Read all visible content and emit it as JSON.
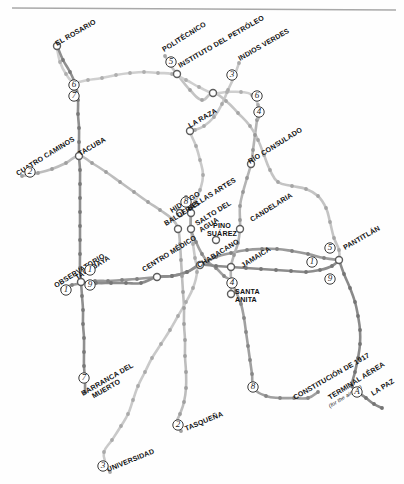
{
  "map": {
    "title": "Mexico City Metro Schematic Map",
    "width": 404,
    "height": 484,
    "background_color": "#fefefe",
    "top_rule_color": "#a8a8a8",
    "style": "grayscale schematic transit diagram"
  },
  "palette": {
    "line_1": "#9a9a9a",
    "line_2": "#bdbdbd",
    "line_3": "#c9c9c9",
    "line_4": "#b4b4b4",
    "line_5": "#c4c4c4",
    "line_6": "#cfcfcf",
    "line_7": "#8f8f8f",
    "line_8": "#a0a0a0",
    "line_9": "#8c8c8c",
    "line_A": "#8a8a8a",
    "station_dot": "#9d9d9d",
    "hub_stroke": "#5d5d5d",
    "label_text": "#111111",
    "badge_text": "#1c1c1c"
  },
  "line_badges": [
    {
      "id": "badge-6-rosario",
      "label": "6",
      "x": 74,
      "y": 85
    },
    {
      "id": "badge-7-rosario",
      "label": "7",
      "x": 74,
      "y": 96
    },
    {
      "id": "badge-2-cuatrocaminos",
      "label": "2",
      "x": 30,
      "y": 172
    },
    {
      "id": "badge-5-politecnico",
      "label": "5",
      "x": 171,
      "y": 62
    },
    {
      "id": "badge-3-indiosverdes",
      "label": "3",
      "x": 232,
      "y": 75
    },
    {
      "id": "badge-6-east",
      "label": "6",
      "x": 257,
      "y": 96
    },
    {
      "id": "badge-4-east",
      "label": "4",
      "x": 259,
      "y": 112
    },
    {
      "id": "badge-8-bellasartes",
      "label": "8",
      "x": 186,
      "y": 202
    },
    {
      "id": "badge-1-tacubaya-n",
      "label": "1",
      "x": 90,
      "y": 270
    },
    {
      "id": "badge-9-tacubaya",
      "label": "9",
      "x": 90,
      "y": 285
    },
    {
      "id": "badge-1-observatorio",
      "label": "1",
      "x": 66,
      "y": 290
    },
    {
      "id": "badge-7-barranca",
      "label": "7",
      "x": 84,
      "y": 378
    },
    {
      "id": "badge-3-universidad",
      "label": "3",
      "x": 103,
      "y": 466
    },
    {
      "id": "badge-2-tasquena",
      "label": "2",
      "x": 178,
      "y": 425
    },
    {
      "id": "badge-4-santaanita",
      "label": "4",
      "x": 232,
      "y": 283
    },
    {
      "id": "badge-8-constitucion",
      "label": "8",
      "x": 253,
      "y": 387
    },
    {
      "id": "badge-5-pantitlan",
      "label": "5",
      "x": 330,
      "y": 248
    },
    {
      "id": "badge-1-pantitlan",
      "label": "1",
      "x": 312,
      "y": 262
    },
    {
      "id": "badge-9-pantitlan",
      "label": "9",
      "x": 330,
      "y": 279
    },
    {
      "id": "badge-A-lapaz",
      "label": "A",
      "x": 357,
      "y": 392
    }
  ],
  "stations": [
    {
      "id": "el-rosario",
      "label": "EL ROSARIO",
      "x": 57,
      "y": 46,
      "type": "terminal",
      "angle": -30
    },
    {
      "id": "politecnico",
      "label": "POLITÉCNICO",
      "x": 164,
      "y": 52,
      "type": "terminal",
      "angle": -32
    },
    {
      "id": "instituto-del-petroleo",
      "label": "INSTITUTO DEL PETRÓLEO",
      "x": 180,
      "y": 68,
      "type": "hub",
      "angle": -30
    },
    {
      "id": "indios-verdes",
      "label": "INDIOS VERDES",
      "x": 240,
      "y": 61,
      "type": "terminal",
      "angle": -30
    },
    {
      "id": "cuatro-caminos",
      "label": "CUATRO CAMINOS",
      "x": 18,
      "y": 176,
      "type": "terminal",
      "angle": -32
    },
    {
      "id": "tacuba",
      "label": "TACUBA",
      "x": 80,
      "y": 156,
      "type": "hub",
      "angle": -30
    },
    {
      "id": "la-raza",
      "label": "LA RAZA",
      "x": 190,
      "y": 128,
      "type": "hub",
      "angle": -30
    },
    {
      "id": "rio-consulado",
      "label": "RÍO CONSULADO",
      "x": 250,
      "y": 164,
      "type": "hub",
      "angle": -32
    },
    {
      "id": "hidalgo",
      "label": "HIDALGO",
      "x": 172,
      "y": 213,
      "type": "hub",
      "angle": -32
    },
    {
      "id": "bellas-artes",
      "label": "BELLAS ARTES",
      "x": 189,
      "y": 211,
      "type": "hub",
      "angle": -32
    },
    {
      "id": "salto-del-agua",
      "label": "SALTO DEL AGUA",
      "x": 197,
      "y": 226,
      "type": "hub",
      "angle": -32
    },
    {
      "id": "balderas",
      "label": "BALDERAS",
      "x": 166,
      "y": 226,
      "type": "hub",
      "angle": -32
    },
    {
      "id": "pino-suarez",
      "label": "PINO SUÁREZ",
      "x": 222,
      "y": 228,
      "type": "hub",
      "angle": 0
    },
    {
      "id": "candelaria",
      "label": "CANDELARIA",
      "x": 252,
      "y": 222,
      "type": "hub",
      "angle": -32
    },
    {
      "id": "jamaica",
      "label": "JAMAICA",
      "x": 243,
      "y": 268,
      "type": "hub",
      "angle": -32
    },
    {
      "id": "santa-anita",
      "label": "SANTA ANITA",
      "x": 235,
      "y": 294,
      "type": "hub",
      "angle": 0
    },
    {
      "id": "chabacano",
      "label": "CHABACANO",
      "x": 199,
      "y": 268,
      "type": "hub",
      "angle": -32
    },
    {
      "id": "centro-medico",
      "label": "CENTRO MÉDICO",
      "x": 144,
      "y": 272,
      "type": "hub",
      "angle": -32
    },
    {
      "id": "tacubaya",
      "label": "TACUBAYA",
      "x": 77,
      "y": 280,
      "type": "hub",
      "angle": -32
    },
    {
      "id": "observatorio",
      "label": "OBSERVATORIO",
      "x": 56,
      "y": 288,
      "type": "terminal",
      "angle": -32
    },
    {
      "id": "barranca-del-muerto",
      "label": "BARRANCA DEL MUERTO",
      "x": 83,
      "y": 396,
      "type": "terminal",
      "angle": -30
    },
    {
      "id": "universidad",
      "label": "UNIVERSIDAD",
      "x": 108,
      "y": 472,
      "type": "terminal",
      "angle": -22
    },
    {
      "id": "tasquena",
      "label": "TASQUEÑA",
      "x": 186,
      "y": 431,
      "type": "terminal",
      "angle": -22
    },
    {
      "id": "constitucion-de-1917",
      "label": "CONSTITUCIÓN DE 1917",
      "x": 295,
      "y": 400,
      "type": "terminal",
      "angle": -30
    },
    {
      "id": "terminal-aerea",
      "label": "TERMINAL AÉREA",
      "x": 330,
      "y": 400,
      "type": "terminal",
      "angle": -32
    },
    {
      "id": "terminal-aerea-sub",
      "label": "(for the airport)",
      "x": 330,
      "y": 408,
      "type": "sublabel",
      "angle": -32
    },
    {
      "id": "pantitlan",
      "label": "PANTITLÁN",
      "x": 345,
      "y": 250,
      "type": "hub",
      "angle": -30
    },
    {
      "id": "la-paz",
      "label": "LA PAZ",
      "x": 373,
      "y": 396,
      "type": "terminal",
      "angle": -32
    }
  ],
  "interchange_nodes": [
    {
      "id": "node-el-rosario",
      "x": 57,
      "y": 46
    },
    {
      "id": "node-instituto-petroleo",
      "x": 177,
      "y": 74
    },
    {
      "id": "node-tacuba",
      "x": 79,
      "y": 156
    },
    {
      "id": "node-la-raza",
      "x": 190,
      "y": 131
    },
    {
      "id": "node-deportivo-18",
      "x": 213,
      "y": 93
    },
    {
      "id": "node-rio-consulado",
      "x": 251,
      "y": 164
    },
    {
      "id": "node-hidalgo",
      "x": 180,
      "y": 213
    },
    {
      "id": "node-bellas-artes",
      "x": 191,
      "y": 213
    },
    {
      "id": "node-balderas",
      "x": 178,
      "y": 229
    },
    {
      "id": "node-salto-agua",
      "x": 191,
      "y": 229
    },
    {
      "id": "node-pino-suarez",
      "x": 216,
      "y": 240
    },
    {
      "id": "node-candelaria",
      "x": 240,
      "y": 229
    },
    {
      "id": "node-chabacano",
      "x": 200,
      "y": 265
    },
    {
      "id": "node-centro-medico",
      "x": 157,
      "y": 277
    },
    {
      "id": "node-jamaica",
      "x": 231,
      "y": 267
    },
    {
      "id": "node-santa-anita",
      "x": 231,
      "y": 294
    },
    {
      "id": "node-tacubaya",
      "x": 81,
      "y": 282
    },
    {
      "id": "node-pantitlan",
      "x": 339,
      "y": 260
    }
  ],
  "lines": [
    {
      "id": "line-1",
      "name": "Línea 1",
      "color": "#9a9a9a",
      "terminals": [
        "OBSERVATORIO",
        "PANTITLÁN"
      ]
    },
    {
      "id": "line-2",
      "name": "Línea 2",
      "color": "#bdbdbd",
      "terminals": [
        "CUATRO CAMINOS",
        "TASQUEÑA"
      ]
    },
    {
      "id": "line-3",
      "name": "Línea 3",
      "color": "#c9c9c9",
      "terminals": [
        "INDIOS VERDES",
        "UNIVERSIDAD"
      ]
    },
    {
      "id": "line-4",
      "name": "Línea 4",
      "color": "#b4b4b4",
      "terminals": [
        "MARTÍN CARRERA",
        "SANTA ANITA"
      ]
    },
    {
      "id": "line-5",
      "name": "Línea 5",
      "color": "#c4c4c4",
      "terminals": [
        "POLITÉCNICO",
        "PANTITLÁN"
      ]
    },
    {
      "id": "line-6",
      "name": "Línea 6",
      "color": "#cfcfcf",
      "terminals": [
        "EL ROSARIO",
        "MARTÍN CARRERA"
      ]
    },
    {
      "id": "line-7",
      "name": "Línea 7",
      "color": "#8f8f8f",
      "terminals": [
        "EL ROSARIO",
        "BARRANCA DEL MUERTO"
      ]
    },
    {
      "id": "line-8",
      "name": "Línea 8",
      "color": "#a0a0a0",
      "terminals": [
        "GARIBALDI",
        "CONSTITUCIÓN DE 1917"
      ]
    },
    {
      "id": "line-9",
      "name": "Línea 9",
      "color": "#8c8c8c",
      "terminals": [
        "TACUBAYA",
        "PANTITLÁN"
      ]
    },
    {
      "id": "line-A",
      "name": "Línea A",
      "color": "#8a8a8a",
      "terminals": [
        "PANTITLÁN",
        "LA PAZ"
      ]
    }
  ],
  "dots_line_1": [
    [
      62,
      289
    ],
    [
      72,
      285
    ],
    [
      95,
      281
    ],
    [
      108,
      281
    ],
    [
      122,
      280
    ],
    [
      137,
      279
    ],
    [
      157,
      277
    ],
    [
      172,
      276
    ],
    [
      187,
      272
    ],
    [
      200,
      265
    ],
    [
      216,
      257
    ],
    [
      231,
      253
    ],
    [
      247,
      250
    ],
    [
      262,
      249
    ],
    [
      277,
      249
    ],
    [
      292,
      251
    ],
    [
      308,
      254
    ],
    [
      324,
      258
    ],
    [
      339,
      260
    ]
  ],
  "dots_line_2": [
    [
      22,
      176
    ],
    [
      38,
      173
    ],
    [
      52,
      169
    ],
    [
      66,
      163
    ],
    [
      79,
      156
    ],
    [
      92,
      163
    ],
    [
      106,
      172
    ],
    [
      120,
      182
    ],
    [
      134,
      192
    ],
    [
      148,
      202
    ],
    [
      160,
      210
    ],
    [
      172,
      219
    ],
    [
      178,
      229
    ],
    [
      180,
      244
    ],
    [
      181,
      260
    ],
    [
      182,
      276
    ],
    [
      183,
      292
    ],
    [
      184,
      308
    ],
    [
      184,
      324
    ],
    [
      185,
      340
    ],
    [
      185,
      356
    ],
    [
      186,
      372
    ],
    [
      186,
      388
    ],
    [
      184,
      402
    ],
    [
      180,
      414
    ],
    [
      176,
      424
    ],
    [
      181,
      431
    ]
  ],
  "dots_line_3": [
    [
      239,
      63
    ],
    [
      234,
      77
    ],
    [
      228,
      90
    ],
    [
      222,
      104
    ],
    [
      214,
      117
    ],
    [
      204,
      126
    ],
    [
      195,
      130
    ],
    [
      190,
      131
    ],
    [
      196,
      146
    ],
    [
      200,
      160
    ],
    [
      203,
      175
    ],
    [
      200,
      190
    ],
    [
      195,
      202
    ],
    [
      191,
      213
    ],
    [
      191,
      229
    ],
    [
      193,
      244
    ],
    [
      195,
      258
    ],
    [
      197,
      272
    ],
    [
      193,
      288
    ],
    [
      186,
      302
    ],
    [
      178,
      316
    ],
    [
      170,
      330
    ],
    [
      161,
      344
    ],
    [
      152,
      358
    ],
    [
      145,
      372
    ],
    [
      138,
      386
    ],
    [
      133,
      400
    ],
    [
      128,
      414
    ],
    [
      121,
      426
    ],
    [
      112,
      440
    ],
    [
      104,
      452
    ],
    [
      106,
      464
    ],
    [
      110,
      472
    ]
  ],
  "dots_line_4": [
    [
      257,
      120
    ],
    [
      255,
      135
    ],
    [
      253,
      150
    ],
    [
      251,
      164
    ],
    [
      247,
      178
    ],
    [
      243,
      192
    ],
    [
      240,
      206
    ],
    [
      240,
      220
    ],
    [
      240,
      229
    ],
    [
      238,
      243
    ],
    [
      234,
      255
    ],
    [
      231,
      267
    ],
    [
      231,
      281
    ],
    [
      231,
      294
    ]
  ],
  "dots_line_5": [
    [
      165,
      56
    ],
    [
      171,
      66
    ],
    [
      177,
      74
    ],
    [
      190,
      90
    ],
    [
      202,
      100
    ],
    [
      213,
      93
    ],
    [
      226,
      101
    ],
    [
      238,
      113
    ],
    [
      250,
      126
    ],
    [
      258,
      140
    ],
    [
      264,
      155
    ],
    [
      270,
      170
    ],
    [
      278,
      182
    ],
    [
      292,
      186
    ],
    [
      306,
      189
    ],
    [
      318,
      196
    ],
    [
      326,
      208
    ],
    [
      330,
      222
    ],
    [
      334,
      238
    ],
    [
      339,
      250
    ],
    [
      339,
      260
    ]
  ],
  "dots_line_6": [
    [
      57,
      48
    ],
    [
      60,
      62
    ],
    [
      66,
      74
    ],
    [
      74,
      82
    ],
    [
      88,
      80
    ],
    [
      102,
      78
    ],
    [
      116,
      75
    ],
    [
      130,
      73
    ],
    [
      144,
      72
    ],
    [
      158,
      73
    ],
    [
      172,
      74
    ],
    [
      186,
      80
    ],
    [
      199,
      87
    ],
    [
      213,
      93
    ],
    [
      227,
      92
    ],
    [
      241,
      92
    ],
    [
      252,
      95
    ],
    [
      258,
      105
    ],
    [
      258,
      118
    ]
  ],
  "dots_line_7": [
    [
      58,
      48
    ],
    [
      63,
      60
    ],
    [
      70,
      72
    ],
    [
      76,
      86
    ],
    [
      78,
      100
    ],
    [
      78,
      114
    ],
    [
      79,
      128
    ],
    [
      79,
      142
    ],
    [
      79,
      156
    ],
    [
      80,
      170
    ],
    [
      80,
      184
    ],
    [
      80,
      198
    ],
    [
      80,
      212
    ],
    [
      80,
      226
    ],
    [
      80,
      240
    ],
    [
      80,
      254
    ],
    [
      80,
      268
    ],
    [
      81,
      282
    ],
    [
      82,
      296
    ],
    [
      83,
      310
    ],
    [
      83,
      324
    ],
    [
      84,
      338
    ],
    [
      84,
      352
    ],
    [
      84,
      366
    ],
    [
      85,
      380
    ],
    [
      85,
      392
    ]
  ],
  "dots_line_8": [
    [
      186,
      197
    ],
    [
      190,
      208
    ],
    [
      191,
      213
    ],
    [
      191,
      229
    ],
    [
      196,
      242
    ],
    [
      202,
      254
    ],
    [
      208,
      262
    ],
    [
      216,
      268
    ],
    [
      224,
      276
    ],
    [
      231,
      281
    ],
    [
      236,
      292
    ],
    [
      241,
      304
    ],
    [
      244,
      318
    ],
    [
      246,
      332
    ],
    [
      248,
      346
    ],
    [
      250,
      360
    ],
    [
      252,
      374
    ],
    [
      254,
      388
    ],
    [
      266,
      396
    ],
    [
      280,
      398
    ],
    [
      294,
      398
    ],
    [
      308,
      398
    ],
    [
      318,
      392
    ]
  ],
  "dots_line_9": [
    [
      81,
      282
    ],
    [
      96,
      283
    ],
    [
      111,
      283
    ],
    [
      126,
      283
    ],
    [
      141,
      283
    ],
    [
      157,
      277
    ],
    [
      172,
      276
    ],
    [
      187,
      272
    ],
    [
      200,
      265
    ],
    [
      216,
      266
    ],
    [
      231,
      267
    ],
    [
      246,
      268
    ],
    [
      261,
      269
    ],
    [
      276,
      270
    ],
    [
      291,
      271
    ],
    [
      306,
      272
    ],
    [
      320,
      270
    ],
    [
      332,
      266
    ],
    [
      339,
      260
    ]
  ],
  "dots_line_A": [
    [
      339,
      260
    ],
    [
      344,
      274
    ],
    [
      350,
      288
    ],
    [
      355,
      302
    ],
    [
      358,
      316
    ],
    [
      360,
      330
    ],
    [
      360,
      344
    ],
    [
      358,
      358
    ],
    [
      355,
      372
    ],
    [
      352,
      386
    ],
    [
      358,
      392
    ],
    [
      366,
      398
    ],
    [
      374,
      404
    ],
    [
      382,
      408
    ]
  ]
}
